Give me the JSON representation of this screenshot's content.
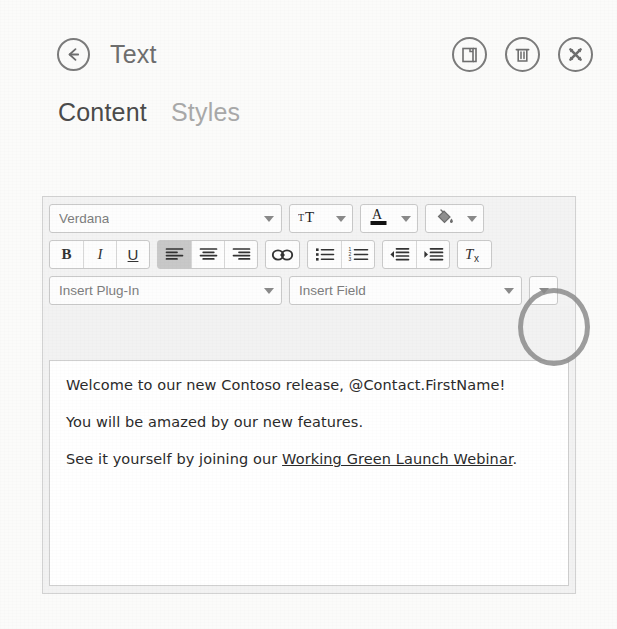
{
  "header": {
    "back_icon": "back-arrow-icon",
    "title": "Text",
    "actions": [
      {
        "name": "duplicate-button",
        "icon": "copy-page-icon",
        "label": "Duplicate"
      },
      {
        "name": "delete-button",
        "icon": "trash-icon",
        "label": "Delete"
      },
      {
        "name": "close-button",
        "icon": "close-x-icon",
        "label": "Close"
      }
    ]
  },
  "tabs": [
    {
      "label": "Content",
      "active": true
    },
    {
      "label": "Styles",
      "active": false
    }
  ],
  "editor": {
    "toolbar": {
      "row1": {
        "font_family": {
          "value": "Verdana",
          "placeholder": "Font"
        },
        "font_size": {
          "icon": "font-size-icon",
          "label": "Font size"
        },
        "font_color": {
          "icon": "font-color-icon",
          "label": "Font color",
          "swatch": "#111111"
        },
        "highlight_color": {
          "icon": "paint-bucket-icon",
          "label": "Highlight color",
          "swatch": "#8f8f8f"
        }
      },
      "row2": {
        "bold": "B",
        "italic": "I",
        "underline": "U",
        "align_left": {
          "icon": "align-left-icon",
          "active": true
        },
        "align_center": {
          "icon": "align-center-icon",
          "active": false
        },
        "align_right": {
          "icon": "align-right-icon",
          "active": false
        },
        "link": {
          "icon": "link-chain-icon"
        },
        "bullet_list": {
          "icon": "bullet-list-icon"
        },
        "numbered_list": {
          "icon": "numbered-list-icon"
        },
        "decrease_indent": {
          "icon": "decrease-indent-icon"
        },
        "increase_indent": {
          "icon": "increase-indent-icon"
        },
        "clear_format": {
          "icon": "clear-formatting-icon",
          "label": "Tx"
        }
      },
      "row3": {
        "insert_plugin": {
          "value": "Insert Plug-In",
          "placeholder": "Insert Plug-In"
        },
        "insert_field": {
          "value": "Insert Field",
          "placeholder": "Insert Field"
        },
        "more_options": {
          "icon": "chevron-down-icon",
          "label": "More"
        }
      }
    },
    "body": {
      "paragraphs": [
        {
          "text": "Welcome to our new Contoso release, @Contact.FirstName!",
          "link": null
        },
        {
          "text": "You will be amazed by our new features.",
          "link": null
        },
        {
          "prefix": "See it yourself by joining our ",
          "link": "Working Green Launch Webinar",
          "suffix": "."
        }
      ]
    }
  },
  "colors": {
    "page_background": "#fbfbfa",
    "toolbar_background": "#f3f3f3",
    "content_background": "#ffffff",
    "title_text": "#6e6e6e",
    "tab_active": "#4b4b4b",
    "tab_inactive": "#a9a9a9",
    "annotation": "#8c8c8c",
    "border": "#d2d2d2"
  },
  "annotation": {
    "shape": "ellipse",
    "target": "more-options-dropdown"
  }
}
